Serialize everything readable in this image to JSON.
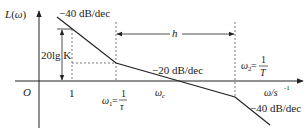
{
  "diagram": {
    "type": "bode-magnitude-asymptote",
    "y_axis_label": "L(ω)",
    "x_axis_label": "ω/s",
    "x_axis_unit_exp": "-1",
    "origin_label": "O",
    "tick_one_label": "1",
    "gain_label": "20lg K",
    "span_label": "h",
    "slopes": {
      "first": "−40 dB/dec",
      "middle": "−20 dB/dec",
      "last": "−40 dB/dec"
    },
    "omega1": {
      "symbol": "ω",
      "sub": "1",
      "eq": "=",
      "num": "1",
      "den": "τ"
    },
    "omega2": {
      "symbol": "ω",
      "sub": "2",
      "eq": "=",
      "num": "1",
      "den": "T"
    },
    "omegac": {
      "symbol": "ω",
      "sub": "c"
    },
    "colors": {
      "line": "#222222",
      "dashed": "#555555"
    }
  }
}
